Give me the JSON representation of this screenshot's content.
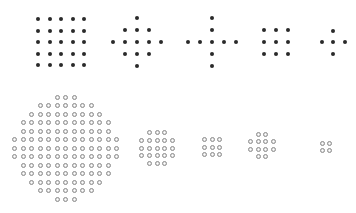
{
  "figure": {
    "colors": {
      "filled": "#2a2a2a",
      "hollow_stroke": "#8a8a8a",
      "background": "#ffffff"
    },
    "top_row": [
      {
        "name": "square-5x5",
        "type": "grid",
        "cx": 61,
        "cy": 42,
        "spacing": 11.5,
        "cols": 5,
        "rows": 5,
        "dot_size": 4,
        "style": "filled"
      },
      {
        "name": "diamond-13",
        "type": "rows",
        "cx": 137,
        "cy": 42,
        "spacing": 11.8,
        "row_counts": [
          1,
          3,
          5,
          3,
          1
        ],
        "dot_size": 4,
        "style": "filled"
      },
      {
        "name": "cross-9",
        "type": "cross",
        "cx": 212,
        "cy": 42,
        "spacing": 11.8,
        "arm": 2,
        "dot_size": 4,
        "style": "filled"
      },
      {
        "name": "square-3x3",
        "type": "grid",
        "cx": 276,
        "cy": 42,
        "spacing": 11.8,
        "cols": 3,
        "rows": 3,
        "dot_size": 4,
        "style": "filled"
      },
      {
        "name": "plus-5",
        "type": "cross",
        "cx": 333,
        "cy": 42,
        "spacing": 11.5,
        "arm": 1,
        "dot_size": 4,
        "style": "filled"
      }
    ],
    "bottom_row": [
      {
        "name": "disk-large",
        "type": "rows",
        "cx": 65.5,
        "cy": 148,
        "spacing": 8.5,
        "row_counts": [
          3,
          7,
          9,
          11,
          11,
          13,
          13,
          13,
          11,
          11,
          9,
          7,
          3
        ],
        "dot_size": 5,
        "style": "hollow"
      },
      {
        "name": "disk-medium",
        "type": "rows",
        "cx": 157,
        "cy": 148,
        "spacing": 7.6,
        "row_counts": [
          3,
          5,
          5,
          5,
          3
        ],
        "dot_size": 5,
        "style": "hollow"
      },
      {
        "name": "square-3x3-hollow",
        "type": "grid",
        "cx": 212,
        "cy": 147,
        "spacing": 7.2,
        "cols": 3,
        "rows": 3,
        "dot_size": 5,
        "style": "hollow"
      },
      {
        "name": "disk-small",
        "type": "rows",
        "cx": 262,
        "cy": 145.5,
        "spacing": 7.6,
        "row_counts": [
          2,
          4,
          4,
          2
        ],
        "dot_size": 5,
        "style": "hollow"
      },
      {
        "name": "square-2x2-hollow",
        "type": "grid",
        "cx": 326,
        "cy": 147,
        "spacing": 7.2,
        "cols": 2,
        "rows": 2,
        "dot_size": 5,
        "style": "hollow"
      }
    ]
  }
}
